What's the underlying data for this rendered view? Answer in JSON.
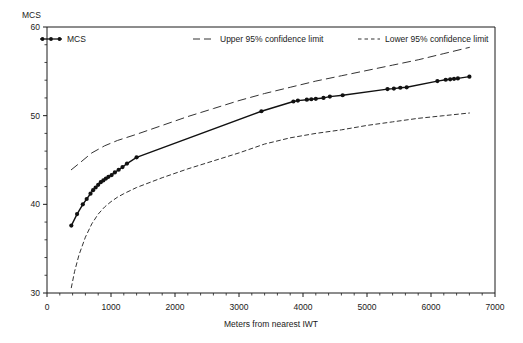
{
  "chart_data": {
    "type": "line",
    "title": "",
    "xlabel": "Meters from nearest IWT",
    "ylabel": "MCS",
    "xlim": [
      0,
      7000
    ],
    "ylim": [
      30,
      60
    ],
    "xticks": [
      0,
      1000,
      2000,
      3000,
      4000,
      5000,
      6000,
      7000
    ],
    "xtick_labels": [
      "0",
      "1000",
      "2000",
      "3000",
      "4000",
      "5000",
      "6000",
      "7000"
    ],
    "yticks": [
      30,
      40,
      50,
      60
    ],
    "ytick_labels": [
      "30",
      "40",
      "50",
      "60"
    ],
    "yminor_step": 2,
    "xminor_step": 200,
    "grid": false,
    "legend_position": "top",
    "legend": [
      {
        "label": "MCS",
        "style": "solid-with-markers",
        "color": "#111111"
      },
      {
        "label": "Upper 95%  confidence limit",
        "style": "long-dashed",
        "color": "#333333"
      },
      {
        "label": "Lower 95%  confidence limit",
        "style": "short-dashed",
        "color": "#333333"
      }
    ],
    "series": [
      {
        "name": "MCS",
        "style": "solid-with-markers",
        "color": "#111111",
        "points": [
          [
            380,
            37.6
          ],
          [
            470,
            38.9
          ],
          [
            560,
            40.0
          ],
          [
            620,
            40.6
          ],
          [
            680,
            41.2
          ],
          [
            720,
            41.6
          ],
          [
            760,
            41.9
          ],
          [
            800,
            42.2
          ],
          [
            840,
            42.5
          ],
          [
            880,
            42.7
          ],
          [
            920,
            42.9
          ],
          [
            960,
            43.1
          ],
          [
            1010,
            43.3
          ],
          [
            1060,
            43.6
          ],
          [
            1120,
            43.9
          ],
          [
            1180,
            44.2
          ],
          [
            1250,
            44.6
          ],
          [
            1400,
            45.3
          ],
          [
            3350,
            50.5
          ],
          [
            3850,
            51.6
          ],
          [
            3920,
            51.7
          ],
          [
            4060,
            51.8
          ],
          [
            4130,
            51.85
          ],
          [
            4200,
            51.9
          ],
          [
            4320,
            52.0
          ],
          [
            4420,
            52.15
          ],
          [
            4620,
            52.3
          ],
          [
            5320,
            53.0
          ],
          [
            5420,
            53.05
          ],
          [
            5520,
            53.15
          ],
          [
            5620,
            53.2
          ],
          [
            6100,
            53.9
          ],
          [
            6230,
            54.05
          ],
          [
            6300,
            54.1
          ],
          [
            6360,
            54.15
          ],
          [
            6420,
            54.2
          ],
          [
            6600,
            54.4
          ]
        ]
      },
      {
        "name": "Upper 95%  confidence limit",
        "style": "long-dashed",
        "color": "#333333",
        "points": [
          [
            380,
            43.9
          ],
          [
            500,
            44.6
          ],
          [
            700,
            45.8
          ],
          [
            900,
            46.6
          ],
          [
            1100,
            47.2
          ],
          [
            1400,
            47.9
          ],
          [
            1800,
            48.9
          ],
          [
            2200,
            49.9
          ],
          [
            2600,
            50.8
          ],
          [
            3000,
            51.7
          ],
          [
            3400,
            52.5
          ],
          [
            3800,
            53.2
          ],
          [
            4200,
            53.9
          ],
          [
            4600,
            54.5
          ],
          [
            5000,
            55.1
          ],
          [
            5400,
            55.7
          ],
          [
            5800,
            56.3
          ],
          [
            6200,
            57.0
          ],
          [
            6600,
            57.7
          ]
        ]
      },
      {
        "name": "Lower 95%  confidence limit",
        "style": "short-dashed",
        "color": "#333333",
        "points": [
          [
            380,
            30.6
          ],
          [
            430,
            32.4
          ],
          [
            500,
            34.3
          ],
          [
            600,
            36.3
          ],
          [
            700,
            37.8
          ],
          [
            800,
            38.9
          ],
          [
            900,
            39.7
          ],
          [
            1000,
            40.3
          ],
          [
            1100,
            40.8
          ],
          [
            1200,
            41.2
          ],
          [
            1400,
            41.9
          ],
          [
            1800,
            43.0
          ],
          [
            2200,
            44.0
          ],
          [
            2600,
            44.9
          ],
          [
            3000,
            45.8
          ],
          [
            3400,
            46.8
          ],
          [
            3800,
            47.5
          ],
          [
            4200,
            48.0
          ],
          [
            4600,
            48.4
          ],
          [
            5000,
            48.9
          ],
          [
            5400,
            49.3
          ],
          [
            5800,
            49.7
          ],
          [
            6200,
            50.0
          ],
          [
            6600,
            50.3
          ]
        ]
      }
    ]
  }
}
